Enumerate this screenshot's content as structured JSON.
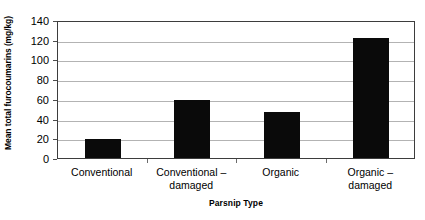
{
  "chart_data": {
    "type": "bar",
    "title": "",
    "subtitle": "",
    "xlabel": "Parsnip Type",
    "ylabel": "Mean total furocoumarins (mg/kg)",
    "categories": [
      "Conventional",
      "Conventional – damaged",
      "Organic",
      "Organic – damaged"
    ],
    "category_lines": [
      [
        "Conventional"
      ],
      [
        "Conventional –",
        "damaged"
      ],
      [
        "Organic"
      ],
      [
        "Organic –",
        "damaged"
      ]
    ],
    "values": [
      19.5,
      58.5,
      46.5,
      122
    ],
    "ylim": [
      0,
      140
    ],
    "ytick_values": [
      0,
      20,
      40,
      60,
      80,
      100,
      120,
      140
    ],
    "ytick_labels": [
      "0",
      "20",
      "40",
      "60",
      "80",
      "100",
      "120",
      "140"
    ],
    "grid": "horizontal",
    "legend": "none",
    "bar_color": "#0a0a0a",
    "gridline_color": "#b3b3b3",
    "axis_color": "#3d3d3d",
    "plot_background": "#ffffff"
  }
}
